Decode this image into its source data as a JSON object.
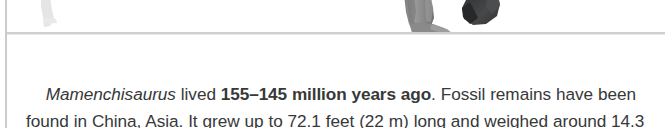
{
  "fact_box": {
    "text_lines": [
      {
        "segments": [
          {
            "text": "Mamenchisaurus",
            "style": "italic",
            "name": "genus-name"
          },
          {
            "text": " lived ",
            "style": "regular",
            "name": "text-run"
          },
          {
            "text": "155–145 million years ago",
            "style": "bold",
            "name": "time-period"
          },
          {
            "text": ". Fossil remains have",
            "style": "regular",
            "name": "text-run"
          }
        ]
      },
      {
        "segments": [
          {
            "text": "been found in China, Asia. It grew up to 72.1 feet (22 m) long and",
            "style": "regular",
            "name": "text-run"
          }
        ]
      },
      {
        "segments": [
          {
            "text": "weighed around 14.3 tons (13 tonnes).",
            "style": "regular",
            "name": "text-run"
          }
        ]
      }
    ],
    "full_text": "Mamenchisaurus lived 155–145 million years ago. Fossil remains have been found in China, Asia. It grew up to 72.1 feet (22 m) long and weighed around 14.3 tons (13 tonnes).",
    "facts": {
      "genus": "Mamenchisaurus",
      "period_range": "155–145 million years ago",
      "period_start_mya": 155,
      "period_end_mya": 145,
      "location_country": "China",
      "location_continent": "Asia",
      "length_feet": 72.1,
      "length_meters": 22,
      "weight_tons": 14.3,
      "weight_tonnes": 13
    }
  },
  "illustration": {
    "description": "cropped dinosaur legs and feet standing on the rule",
    "shapes": [
      {
        "name": "faint-left-leg",
        "color": "#e3e4e5"
      },
      {
        "name": "gray-leg-and-foot",
        "color": "#8d8d8d"
      },
      {
        "name": "dark-leg",
        "color": "#3b3c3e"
      }
    ]
  },
  "colors": {
    "page_background": "#ffffff",
    "text": "#373838",
    "rule": "#c9cbcd",
    "divider": "#cdcfd1"
  }
}
